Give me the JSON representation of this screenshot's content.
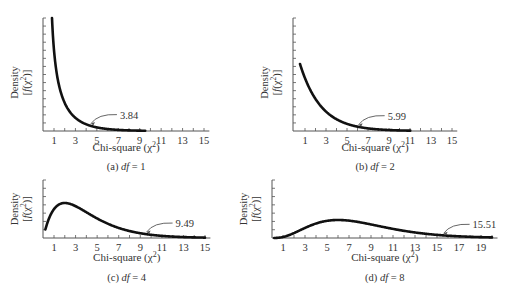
{
  "chart_data": [
    {
      "id": "a",
      "type": "line",
      "title": "(a) df = 1",
      "caption_prefix": "(a) ",
      "caption_var": "df",
      "caption_suffix": " = 1",
      "df": 1,
      "xlabel": "Chi-square (χ2)",
      "ylabel": [
        "Density",
        "[f(χ2)]"
      ],
      "x_ticks": [
        1,
        3,
        5,
        7,
        9,
        11,
        13,
        15
      ],
      "xlim": [
        0,
        15.5
      ],
      "curve_x_range": [
        0.3,
        9
      ],
      "critical_value": 3.84,
      "annotation": "3.84",
      "grid": false
    },
    {
      "id": "b",
      "type": "line",
      "title": "(b) df = 2",
      "caption_prefix": "(b) ",
      "caption_var": "df",
      "caption_suffix": " = 2",
      "df": 2,
      "xlabel": "Chi-square (χ2)",
      "ylabel": [
        "Density",
        "[f(χ2)]"
      ],
      "x_ticks": [
        1,
        3,
        5,
        7,
        9,
        11,
        13,
        15
      ],
      "xlim": [
        0,
        15.5
      ],
      "curve_x_range": [
        0.5,
        11
      ],
      "critical_value": 5.99,
      "annotation": "5.99",
      "grid": false
    },
    {
      "id": "c",
      "type": "line",
      "title": "(c) df = 4",
      "caption_prefix": "(c) ",
      "caption_var": "df",
      "caption_suffix": " = 4",
      "df": 4,
      "xlabel": "Chi-square (χ2)",
      "ylabel": [
        "Density",
        "[f(χ2)]"
      ],
      "x_ticks": [
        1,
        3,
        5,
        7,
        9,
        11,
        13,
        15
      ],
      "xlim": [
        0,
        15.5
      ],
      "curve_x_range": [
        0.2,
        15
      ],
      "critical_value": 9.49,
      "annotation": "9.49",
      "grid": false
    },
    {
      "id": "d",
      "type": "line",
      "title": "(d) df = 8",
      "caption_prefix": "(d) ",
      "caption_var": "df",
      "caption_suffix": " = 8",
      "df": 8,
      "xlabel": "Chi-square (χ2)",
      "ylabel": [
        "Density",
        "[f(χ2)]"
      ],
      "x_ticks": [
        1,
        3,
        5,
        7,
        9,
        11,
        13,
        15,
        17,
        19
      ],
      "xlim": [
        0,
        20.5
      ],
      "curve_x_range": [
        0.2,
        20
      ],
      "critical_value": 15.51,
      "annotation": "15.51",
      "grid": false
    }
  ],
  "labels": {
    "xlabel_text": "Chi-square (χ",
    "xlabel_sup": "2",
    "xlabel_close": ")",
    "density": "Density",
    "fx_open": "[f(χ",
    "fx_sup": "2",
    "fx_close": ")]"
  },
  "colors": {
    "curve": "#111111",
    "axis": "#555555",
    "text": "#333333"
  }
}
